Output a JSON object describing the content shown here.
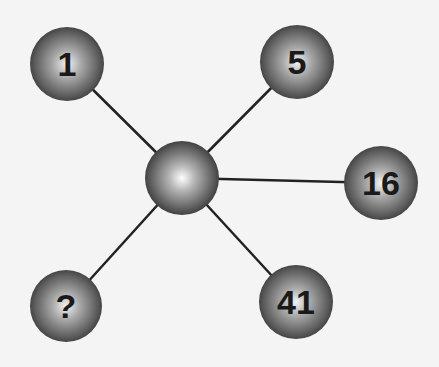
{
  "diagram": {
    "type": "number-puzzle-star",
    "center": {
      "x": 182,
      "y": 178,
      "r": 37,
      "label": ""
    },
    "nodes": [
      {
        "id": "n1",
        "label": "1",
        "x": 67,
        "y": 64,
        "r": 37
      },
      {
        "id": "n5",
        "label": "5",
        "x": 297,
        "y": 62,
        "r": 37
      },
      {
        "id": "n16",
        "label": "16",
        "x": 381,
        "y": 183,
        "r": 37
      },
      {
        "id": "nq",
        "label": "?",
        "x": 66,
        "y": 306,
        "r": 36
      },
      {
        "id": "n41",
        "label": "41",
        "x": 296,
        "y": 302,
        "r": 37
      }
    ],
    "colors": {
      "background": "#f4f4f4",
      "line": "#222222",
      "sphere_light": "#e8e8e8",
      "sphere_mid": "#8a8a8a",
      "sphere_dark": "#3a3a3a",
      "text": "#1a1a1a"
    }
  }
}
